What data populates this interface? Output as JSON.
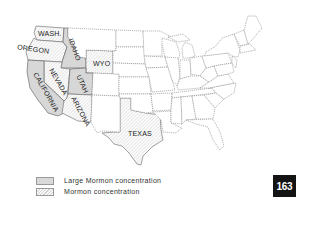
{
  "map": {
    "title": "Mormon concentration in the United States",
    "states_labeled": [
      {
        "name": "WASH.",
        "category": "mormon"
      },
      {
        "name": "OREGON",
        "category": "mormon"
      },
      {
        "name": "IDAHO",
        "category": "large"
      },
      {
        "name": "WYO",
        "category": "mormon"
      },
      {
        "name": "NEVADA",
        "category": "mormon"
      },
      {
        "name": "UTAH",
        "category": "large"
      },
      {
        "name": "CALIFORNIA",
        "category": "large"
      },
      {
        "name": "ARIZONA",
        "category": "mormon"
      },
      {
        "name": "TEXAS",
        "category": "mormon"
      }
    ],
    "colors": {
      "large": "#d9d9d9",
      "mormon_hatch": "#d0d0d0",
      "border": "#8a8a8a",
      "badge": "#141414"
    }
  },
  "legend": {
    "items": [
      {
        "label": "Large Mormon concentration",
        "style": "solid-gray"
      },
      {
        "label": "Mormon concentration",
        "style": "hatched"
      }
    ]
  },
  "page_number": "163"
}
